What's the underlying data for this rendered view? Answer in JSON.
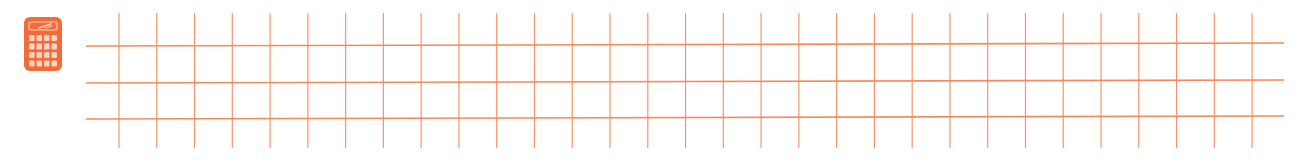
{
  "banner": {
    "icon": "calculator-icon",
    "colors": {
      "accent": "#F26B3A",
      "grid_line": "#F48A5C",
      "background": "#FFFFFF",
      "icon_light": "#FBD3C0"
    },
    "grid": {
      "vertical_count": 31,
      "vertical_start_x": 119,
      "vertical_spacing": 37.77,
      "vertical_top_y": 13,
      "vertical_bottom_y": 148,
      "horizontal_count": 3,
      "horizontal_left_x": 86,
      "horizontal_right_x": 1284,
      "horizontal_left_y": [
        46,
        83,
        119
      ],
      "horizontal_right_y": [
        43,
        80,
        116
      ]
    }
  }
}
